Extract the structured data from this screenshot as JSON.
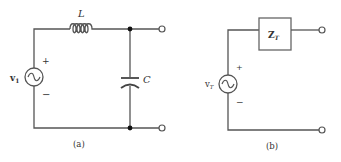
{
  "figure_a": {
    "caption": "(a)",
    "source": {
      "label": "v",
      "subscript": "1",
      "plus": "+",
      "minus": "−"
    },
    "inductor": {
      "label": "L"
    },
    "capacitor": {
      "label": "C"
    }
  },
  "figure_b": {
    "caption": "(b)",
    "source": {
      "label": "v",
      "subscript": "T",
      "plus": "+",
      "minus": "−"
    },
    "impedance": {
      "label": "Z",
      "subscript": "T"
    }
  },
  "colors": {
    "wire": "#555555",
    "text": "#333333",
    "node": "#111111"
  }
}
